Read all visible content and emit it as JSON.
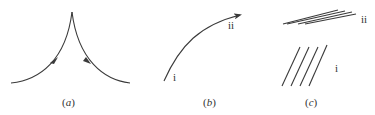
{
  "panels": [
    {
      "id": "a",
      "caption_open": "(",
      "caption_letter": "a",
      "caption_close": ")",
      "description": "Cusp formed by two curves meeting at a point, arrows indicating direction up-left and down-right"
    },
    {
      "id": "b",
      "caption_open": "(",
      "caption_letter": "b",
      "caption_close": ")",
      "label_start": "i",
      "label_end": "ii",
      "description": "Curved arrow from i to ii"
    },
    {
      "id": "c",
      "caption_open": "(",
      "caption_letter": "c",
      "caption_close": ")",
      "label_top": "ii",
      "label_bottom": "i",
      "description": "Group of steep parallel lines (i) and nearly horizontal parallel lines (ii)"
    }
  ],
  "colors": {
    "stroke": "#3a3a3a",
    "background": "#ffffff"
  }
}
